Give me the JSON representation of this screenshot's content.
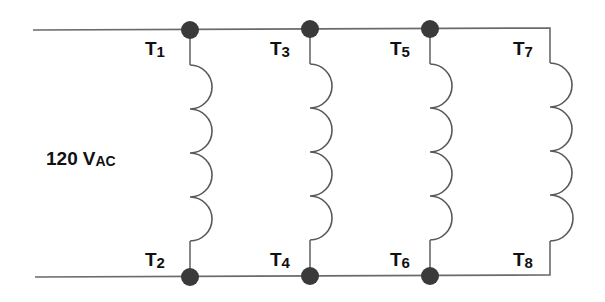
{
  "diagram": {
    "type": "parallel coil connection (motor windings)",
    "source_label": {
      "value": "120",
      "unit_main": "V",
      "unit_sub": "AC"
    },
    "terminals": [
      {
        "name": "T",
        "sub": "1",
        "position": "top",
        "column": 1
      },
      {
        "name": "T",
        "sub": "2",
        "position": "bottom",
        "column": 1
      },
      {
        "name": "T",
        "sub": "3",
        "position": "top",
        "column": 2
      },
      {
        "name": "T",
        "sub": "4",
        "position": "bottom",
        "column": 2
      },
      {
        "name": "T",
        "sub": "5",
        "position": "top",
        "column": 3
      },
      {
        "name": "T",
        "sub": "6",
        "position": "bottom",
        "column": 3
      },
      {
        "name": "T",
        "sub": "7",
        "position": "top",
        "column": 4
      },
      {
        "name": "T",
        "sub": "8",
        "position": "bottom",
        "column": 4
      }
    ],
    "coils": [
      {
        "id": "coil-1",
        "between": [
          "T1",
          "T2"
        ],
        "turns": 4
      },
      {
        "id": "coil-2",
        "between": [
          "T3",
          "T4"
        ],
        "turns": 4
      },
      {
        "id": "coil-3",
        "between": [
          "T5",
          "T6"
        ],
        "turns": 4
      },
      {
        "id": "coil-4",
        "between": [
          "T7",
          "T8"
        ],
        "turns": 4
      }
    ],
    "junction_nodes": 6,
    "colors": {
      "wire": "#6a6a6a",
      "node": "#3a3a3a",
      "text": "#111111",
      "background": "#ffffff"
    }
  }
}
